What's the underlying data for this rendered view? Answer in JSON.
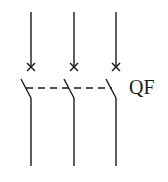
{
  "diagram": {
    "type": "three-pole circuit breaker symbol",
    "label": "QF",
    "poles": [
      {
        "x": 31
      },
      {
        "x": 74
      },
      {
        "x": 116
      }
    ],
    "stroke_color": "#1a1a1a",
    "background": "#ffffff"
  }
}
